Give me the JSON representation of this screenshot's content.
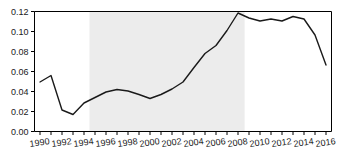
{
  "chart_data": {
    "type": "line",
    "title": "",
    "xlabel": "",
    "ylabel": "",
    "xlim": [
      1989.5,
      2016.5
    ],
    "ylim": [
      0.0,
      0.12
    ],
    "grid": false,
    "legend": null,
    "x": [
      1990,
      1991,
      1992,
      1993,
      1994,
      1995,
      1996,
      1997,
      1998,
      1999,
      2000,
      2001,
      2002,
      2003,
      2004,
      2005,
      2006,
      2007,
      2008,
      2009,
      2010,
      2011,
      2012,
      2013,
      2014,
      2015,
      2016
    ],
    "values": [
      0.0495,
      0.056,
      0.0215,
      0.017,
      0.0285,
      0.034,
      0.0395,
      0.042,
      0.0405,
      0.037,
      0.033,
      0.037,
      0.0425,
      0.0495,
      0.064,
      0.078,
      0.086,
      0.101,
      0.1185,
      0.1135,
      0.1105,
      0.1125,
      0.1105,
      0.115,
      0.1125,
      0.0965,
      0.0665
    ],
    "series": [
      {
        "name": "series-1",
        "color": "#1a1a1a",
        "values": [
          0.0495,
          0.056,
          0.0215,
          0.017,
          0.0285,
          0.034,
          0.0395,
          0.042,
          0.0405,
          0.037,
          0.033,
          0.037,
          0.0425,
          0.0495,
          0.064,
          0.078,
          0.086,
          0.101,
          0.1185,
          0.1135,
          0.1105,
          0.1125,
          0.1105,
          0.115,
          0.1125,
          0.0965,
          0.0665
        ]
      }
    ],
    "y_ticks": [
      0.0,
      0.02,
      0.04,
      0.06,
      0.08,
      0.1,
      0.12
    ],
    "y_tick_labels": [
      "0.00",
      "0.02",
      "0.04",
      "0.06",
      "0.08",
      "0.10",
      "0.12"
    ],
    "x_ticks": [
      1990,
      1991,
      1992,
      1993,
      1994,
      1995,
      1996,
      1997,
      1998,
      1999,
      2000,
      2001,
      2002,
      2003,
      2004,
      2005,
      2006,
      2007,
      2008,
      2009,
      2010,
      2011,
      2012,
      2013,
      2014,
      2015,
      2016
    ],
    "x_tick_labels_shown": [
      "1990",
      "1992",
      "1994",
      "1996",
      "1998",
      "2000",
      "2002",
      "2004",
      "2006",
      "2008",
      "2010",
      "2012",
      "2014",
      "2016"
    ],
    "x_tick_labels_shown_values": [
      1990,
      1992,
      1994,
      1996,
      1998,
      2000,
      2002,
      2004,
      2006,
      2008,
      2010,
      2012,
      2014,
      2016
    ],
    "annotations": [
      {
        "name": "shaded-period",
        "type": "vspan",
        "x_start": 1994.5,
        "x_end": 2008.6,
        "color": "#ececec"
      }
    ],
    "colors": {
      "line": "#1a1a1a",
      "axis": "#000000",
      "shade": "#ececec",
      "background": "#ffffff",
      "tick_label": "#1a1a1a"
    }
  }
}
